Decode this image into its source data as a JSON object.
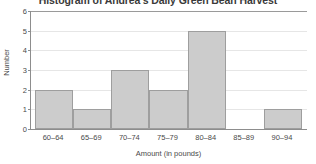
{
  "chart_data": {
    "type": "bar",
    "title": "Histogram of Andrea's Daily Green Bean Harvest",
    "xlabel": "Amount (in pounds)",
    "ylabel": "Number",
    "categories": [
      "60–64",
      "65–69",
      "70–74",
      "75–79",
      "80–84",
      "85–89",
      "90–94"
    ],
    "values": [
      2,
      1,
      3,
      2,
      5,
      0,
      1
    ],
    "ylim": [
      0,
      6
    ],
    "ytick_labels": [
      "0",
      "1",
      "2",
      "3",
      "4",
      "5",
      "6"
    ],
    "ytick_values": [
      0,
      1,
      2,
      3,
      4,
      5,
      6
    ],
    "grid": true,
    "legend": false,
    "colors": {
      "bar_fill": "#cccccc",
      "bar_stroke": "#9e9e9e",
      "gridline": "#e6e6e6",
      "axis": "#8d8d8d",
      "text": "#4a4a4a",
      "title_text": "#3a3a3a",
      "plot_background": "#ffffff"
    }
  }
}
